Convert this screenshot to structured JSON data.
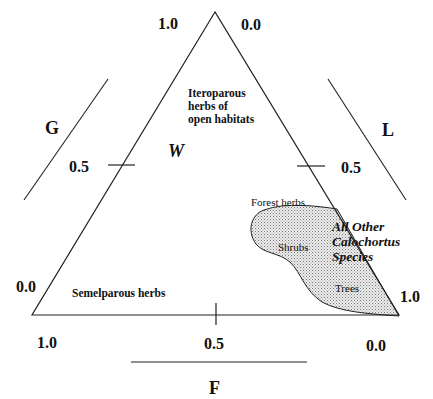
{
  "diagram": {
    "type": "ternary",
    "axes": {
      "G": {
        "label": "G",
        "ticks": {
          "top": "1.0",
          "mid": "0.5",
          "bottom": "0.0"
        }
      },
      "L": {
        "label": "L",
        "ticks": {
          "top": "0.0",
          "mid": "0.5",
          "bottom": "1.0"
        }
      },
      "F": {
        "label": "F",
        "ticks": {
          "left": "1.0",
          "mid": "0.5",
          "right": "0.0"
        }
      }
    },
    "vertex_label": "W",
    "regions": {
      "iteroparous": [
        "Iteroparous",
        "herbs of",
        "open habitats"
      ],
      "semelparous": "Semelparous herbs",
      "forest_herbs": "Forest herbs",
      "shrubs": "Shrubs",
      "trees": "Trees",
      "calochortus": [
        "All Other",
        "Calochortus",
        "Species"
      ]
    },
    "colors": {
      "line": "#222222",
      "shade_fill": "#e4e4e4",
      "shade_dot": "#8a8a8a"
    }
  }
}
